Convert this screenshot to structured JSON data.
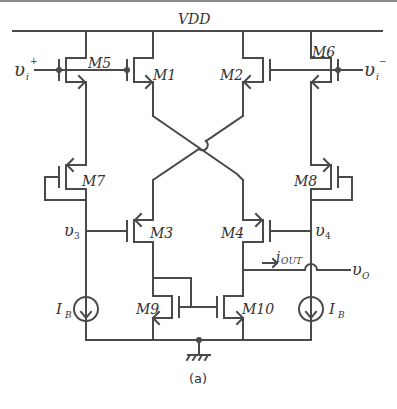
{
  "diagram": {
    "supply_label": "VDD",
    "caption": "(a)",
    "transistors": [
      {
        "id": "M1",
        "label": "M1",
        "type": "pmos"
      },
      {
        "id": "M2",
        "label": "M2",
        "type": "pmos"
      },
      {
        "id": "M3",
        "label": "M3",
        "type": "pmos"
      },
      {
        "id": "M4",
        "label": "M4",
        "type": "pmos"
      },
      {
        "id": "M5",
        "label": "M5",
        "type": "pmos"
      },
      {
        "id": "M6",
        "label": "M6",
        "type": "pmos"
      },
      {
        "id": "M7",
        "label": "M7",
        "type": "pmos"
      },
      {
        "id": "M8",
        "label": "M8",
        "type": "pmos"
      },
      {
        "id": "M9",
        "label": "M9",
        "type": "nmos"
      },
      {
        "id": "M10",
        "label": "M10",
        "type": "nmos"
      }
    ],
    "nodes": {
      "vin_plus": {
        "main": "υ",
        "sub": "i",
        "sup": "+"
      },
      "vin_minus": {
        "main": "υ",
        "sub": "i",
        "sup": "−"
      },
      "v3": {
        "main": "υ",
        "sub": "3"
      },
      "v4": {
        "main": "υ",
        "sub": "4"
      },
      "vout": {
        "main": "υ",
        "sub": "O"
      },
      "iout": {
        "main": "i",
        "sub": "OUT"
      }
    },
    "current_sources": [
      {
        "id": "IB-left",
        "main": "I",
        "sub": "B"
      },
      {
        "id": "IB-right",
        "main": "I",
        "sub": "B"
      }
    ],
    "colors": {
      "wire": "#4a4a4a",
      "text": "#333333",
      "border": "#8a8a8a"
    }
  }
}
